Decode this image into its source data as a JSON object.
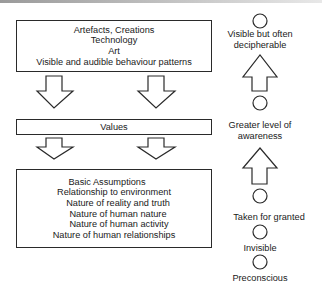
{
  "diagram": {
    "levels": [
      {
        "name": "artefacts",
        "lines": [
          "Artefacts, Creations",
          "Technology",
          "Art",
          "Visible and audible behaviour patterns"
        ]
      },
      {
        "name": "values",
        "lines": [
          "Values"
        ]
      },
      {
        "name": "basic_assumptions",
        "lines": [
          "Basic Assumptions",
          "Relationship to environment",
          "Nature of reality and truth",
          "Nature of human nature",
          "Nature of human activity",
          "Nature of human relationships"
        ]
      }
    ],
    "awareness_scale": {
      "labels": [
        [
          "Visible but often",
          "decipherable"
        ],
        [
          "Greater level of",
          "awareness"
        ],
        [
          "Taken for granted"
        ],
        [
          "Invisible"
        ],
        [
          "Preconscious"
        ]
      ]
    },
    "colors": {
      "stroke": "#2a2a2a",
      "background": "#ffffff",
      "text": "#1a1a1a"
    }
  }
}
